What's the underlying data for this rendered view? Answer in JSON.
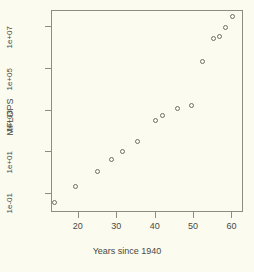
{
  "chart_data": {
    "type": "scatter",
    "title": "",
    "xlabel": "Years since 1940",
    "ylabel": "MFLOPS",
    "xlim": [
      13,
      63
    ],
    "ylim": [
      0.012,
      60000000
    ],
    "yscale": "log",
    "xscale": "linear",
    "grid": false,
    "legend": null,
    "xticks": [
      20,
      30,
      40,
      50,
      60
    ],
    "xtick_labels": [
      "20",
      "30",
      "40",
      "50",
      "60"
    ],
    "yticks": [
      0.1,
      10,
      1000,
      100000,
      10000000
    ],
    "ytick_labels": [
      "1e-01",
      "1e+01",
      "1e+03",
      "1e+05",
      "1e+07"
    ],
    "marker": "open-circle",
    "marker_color": "#6e6e60",
    "points": [
      {
        "x": 14.0,
        "y": 0.035
      },
      {
        "x": 19.5,
        "y": 0.2
      },
      {
        "x": 25.0,
        "y": 1.0
      },
      {
        "x": 28.8,
        "y": 4.0
      },
      {
        "x": 31.7,
        "y": 10.0
      },
      {
        "x": 35.4,
        "y": 30.0
      },
      {
        "x": 40.3,
        "y": 300.0
      },
      {
        "x": 42.0,
        "y": 500.0
      },
      {
        "x": 45.9,
        "y": 1100.0
      },
      {
        "x": 49.6,
        "y": 1500.0
      },
      {
        "x": 52.5,
        "y": 200000.0
      },
      {
        "x": 55.3,
        "y": 2500000.0
      },
      {
        "x": 56.8,
        "y": 3300000.0
      },
      {
        "x": 58.4,
        "y": 8500000.0
      },
      {
        "x": 60.2,
        "y": 30000000.0
      }
    ]
  },
  "colors": {
    "background": "#fbfbf0",
    "axis": "#8d8d7e",
    "text": "#4a4a42",
    "marker": "#6e6e60"
  }
}
